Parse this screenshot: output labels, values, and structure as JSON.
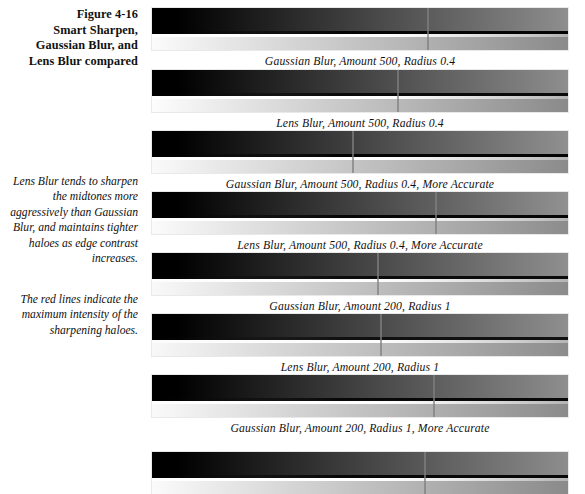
{
  "figure": {
    "number": "Figure 4-16",
    "title_lines": [
      "Smart Sharpen,",
      "Gaussian Blur, and",
      "Lens Blur compared"
    ]
  },
  "notes": [
    "Lens Blur tends to sharpen the midtones more aggressively than Gaussian Blur, and maintains tighter haloes as edge contrast increases.",
    "The red lines indicate the maximum intensity of the sharpening haloes."
  ],
  "colors": {
    "marker_line": "#808080",
    "marker_line_described": "#c0392b",
    "page_background": "#ffffff",
    "text": "#111111"
  },
  "strips": [
    {
      "label": "Gaussian Blur, Amount 500, Radius 0.4",
      "dark_from": "#000000",
      "dark_to": "#8e8e8e",
      "light_from": "#fbfbfb",
      "light_to": "#8a8a8a",
      "halo_dark": "#050505",
      "halo_light": "#ffffff",
      "marker_x": 275,
      "top": 8
    },
    {
      "label": "Lens Blur, Amount 500, Radius 0.4",
      "dark_from": "#000000",
      "dark_to": "#8e8e8e",
      "light_from": "#fdfdfd",
      "light_to": "#8a8a8a",
      "halo_dark": "#0a0a0a",
      "halo_light": "#ffffff",
      "marker_x": 245,
      "top": 70
    },
    {
      "label": "Gaussian Blur, Amount 500, Radius 0.4, More Accurate",
      "dark_from": "#000000",
      "dark_to": "#909090",
      "light_from": "#fafafa",
      "light_to": "#8b8b8b",
      "halo_dark": "#030303",
      "halo_light": "#ffffff",
      "marker_x": 200,
      "top": 131
    },
    {
      "label": "Lens Blur, Amount 500, Radius 0.4, More Accurate",
      "dark_from": "#000000",
      "dark_to": "#919191",
      "light_from": "#fbfbfb",
      "light_to": "#8c8c8c",
      "halo_dark": "#060606",
      "halo_light": "#ffffff",
      "marker_x": 283,
      "top": 192
    },
    {
      "label": "Gaussian Blur, Amount 200, Radius 1",
      "dark_from": "#000000",
      "dark_to": "#8f8f8f",
      "light_from": "#f9f9f9",
      "light_to": "#8b8b8b",
      "halo_dark": "#0b0b0b",
      "halo_light": "#fdfdfd",
      "marker_x": 225,
      "top": 253
    },
    {
      "label": "Lens Blur, Amount 200, Radius 1",
      "dark_from": "#000000",
      "dark_to": "#8f8f8f",
      "light_from": "#f8f8f8",
      "light_to": "#8c8c8c",
      "halo_dark": "#101010",
      "halo_light": "#fcfcfc",
      "marker_x": 228,
      "top": 314
    },
    {
      "label": "Gaussian Blur, Amount 200, Radius 1, More Accurate",
      "dark_from": "#000000",
      "dark_to": "#8e8e8e",
      "light_from": "#fafafa",
      "light_to": "#8b8b8b",
      "halo_dark": "#080808",
      "halo_light": "#ffffff",
      "marker_x": 281,
      "top": 375
    },
    {
      "label": "",
      "dark_from": "#000000",
      "dark_to": "#8d8d8d",
      "light_from": "#fbfbfb",
      "light_to": "#8a8a8a",
      "halo_dark": "#070707",
      "halo_light": "#ffffff",
      "marker_x": 272,
      "top": 452
    }
  ]
}
